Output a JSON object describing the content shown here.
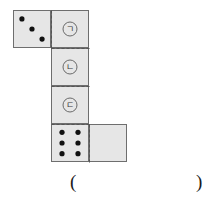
{
  "figure": {
    "colors": {
      "face_fill": "#e6e6e6",
      "outline": "#6e6e6e",
      "fold_line": "#555555",
      "pip": "#111111",
      "label_ring": "#6a6a6a",
      "label_text": "#3a3a3a",
      "background": "#ffffff"
    },
    "faces": [
      {
        "id": "face-three-pips",
        "name": "top-left-face",
        "x": 13,
        "y": 10,
        "size": 38,
        "kind": "pips",
        "pip_count": 3,
        "pips": [
          {
            "cx": 0.235,
            "cy": 0.235
          },
          {
            "cx": 0.5,
            "cy": 0.5
          },
          {
            "cx": 0.765,
            "cy": 0.765
          }
        ]
      },
      {
        "id": "face-label-1",
        "name": "face-giyeok",
        "x": 51,
        "y": 10,
        "size": 38,
        "kind": "label",
        "label": "㉠"
      },
      {
        "id": "face-label-2",
        "name": "face-nieun",
        "x": 51,
        "y": 48,
        "size": 38,
        "kind": "label",
        "label": "㉡"
      },
      {
        "id": "face-label-3",
        "name": "face-digeut",
        "x": 51,
        "y": 86,
        "size": 38,
        "kind": "label",
        "label": "㉢"
      },
      {
        "id": "face-six-pips",
        "name": "bottom-face",
        "x": 51,
        "y": 124,
        "size": 38,
        "kind": "pips",
        "pip_count": 6,
        "pips": [
          {
            "cx": 0.29,
            "cy": 0.22
          },
          {
            "cx": 0.71,
            "cy": 0.22
          },
          {
            "cx": 0.29,
            "cy": 0.5
          },
          {
            "cx": 0.71,
            "cy": 0.5
          },
          {
            "cx": 0.29,
            "cy": 0.78
          },
          {
            "cx": 0.71,
            "cy": 0.78
          }
        ]
      },
      {
        "id": "face-blank",
        "name": "bottom-right-face",
        "x": 89,
        "y": 124,
        "size": 38,
        "kind": "blank",
        "label": ""
      }
    ],
    "fold_lines": [
      {
        "name": "fold-vertical-top",
        "x1": 51,
        "y1": 10,
        "x2": 51,
        "y2": 48
      },
      {
        "name": "fold-horizontal-1",
        "x1": 51,
        "y1": 48,
        "x2": 89,
        "y2": 48
      },
      {
        "name": "fold-horizontal-2",
        "x1": 51,
        "y1": 86,
        "x2": 89,
        "y2": 86
      },
      {
        "name": "fold-horizontal-3",
        "x1": 51,
        "y1": 124,
        "x2": 89,
        "y2": 124
      },
      {
        "name": "fold-vertical-bottom",
        "x1": 89,
        "y1": 124,
        "x2": 89,
        "y2": 162
      }
    ],
    "pip_radius": 2.6
  },
  "answer": {
    "open_paren": "(",
    "close_paren": ")",
    "value": ""
  }
}
